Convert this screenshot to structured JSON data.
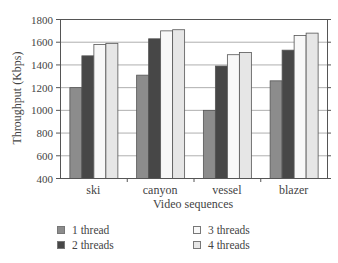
{
  "chart_data": {
    "type": "bar",
    "title": "",
    "xlabel": "Video sequences",
    "ylabel": "Throughput (Kbps)",
    "ylim": [
      400,
      1800
    ],
    "yticks": [
      400,
      600,
      800,
      1000,
      1200,
      1400,
      1600,
      1800
    ],
    "grid": true,
    "legend_position": "bottom",
    "categories": [
      "ski",
      "canyon",
      "vessel",
      "blazer"
    ],
    "series": [
      {
        "name": "1 thread",
        "color": "#8c8c8c",
        "values": [
          1200,
          1310,
          1000,
          1260
        ]
      },
      {
        "name": "2 threads",
        "color": "#474747",
        "values": [
          1480,
          1630,
          1390,
          1530
        ]
      },
      {
        "name": "3 threads",
        "color": "#f8f8f8",
        "values": [
          1580,
          1700,
          1490,
          1660
        ]
      },
      {
        "name": "4 threads",
        "color": "#e6e6e6",
        "values": [
          1590,
          1710,
          1510,
          1680
        ]
      }
    ]
  },
  "legend": {
    "items": [
      {
        "label": "1 thread"
      },
      {
        "label": "2 threads"
      },
      {
        "label": "3 threads"
      },
      {
        "label": "4 threads"
      }
    ]
  }
}
